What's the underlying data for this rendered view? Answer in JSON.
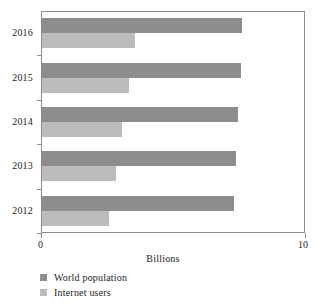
{
  "chart_data": {
    "type": "bar",
    "orientation": "horizontal",
    "title": "",
    "subtitle": "",
    "xlabel": "Billions",
    "ylabel": "",
    "xlim": [
      0,
      10
    ],
    "xticks": [
      0,
      10
    ],
    "xtick_labels": [
      "0",
      "10"
    ],
    "grid": false,
    "legend_position": "bottom-left",
    "categories": [
      "2016",
      "2015",
      "2014",
      "2013",
      "2012"
    ],
    "series": [
      {
        "name": "World population",
        "color": "#8d8d8d",
        "values": [
          7.58,
          7.52,
          7.44,
          7.36,
          7.27
        ]
      },
      {
        "name": "Internet users",
        "color": "#bcbcbc",
        "values": [
          3.52,
          3.31,
          3.02,
          2.8,
          2.54
        ]
      }
    ]
  },
  "axis": {
    "x_title": "Billions",
    "x_tick_min_label": "0",
    "x_tick_max_label": "10",
    "y_tick_labels": [
      "2016",
      "2015",
      "2014",
      "2013",
      "2012"
    ]
  },
  "legend": {
    "items": [
      {
        "label": "World population",
        "color": "#8d8d8d"
      },
      {
        "label": "Internet users",
        "color": "#bcbcbc"
      }
    ]
  },
  "colors": {
    "world_population": "#8d8d8d",
    "internet_users": "#bcbcbc",
    "axis": "#8c8c8c",
    "text": "#242424",
    "background": "#ffffff"
  }
}
